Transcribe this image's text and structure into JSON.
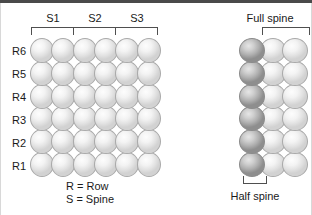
{
  "figure": {
    "title_present": false,
    "background_color": "#ffffff",
    "border_color": "#4a4a4a"
  },
  "left_panel": {
    "name": "row-spine-grid",
    "rows": 6,
    "columns": 6,
    "row_labels": [
      "R6",
      "R5",
      "R4",
      "R3",
      "R2",
      "R1"
    ],
    "spine_labels": [
      "S1",
      "S2",
      "S3"
    ],
    "sphere_fill": "#f0f0f0",
    "sphere_stroke": "#a9a9a9",
    "caption_lines": [
      "R = Row",
      "S = Spine"
    ]
  },
  "right_panel": {
    "name": "spine-detail",
    "rows": 6,
    "columns": 3,
    "full_spine_label": "Full spine",
    "half_spine_label": "Half spine",
    "half_spine_fill": "#b4b4b4",
    "full_spine_fill": "#f0f0f0"
  }
}
